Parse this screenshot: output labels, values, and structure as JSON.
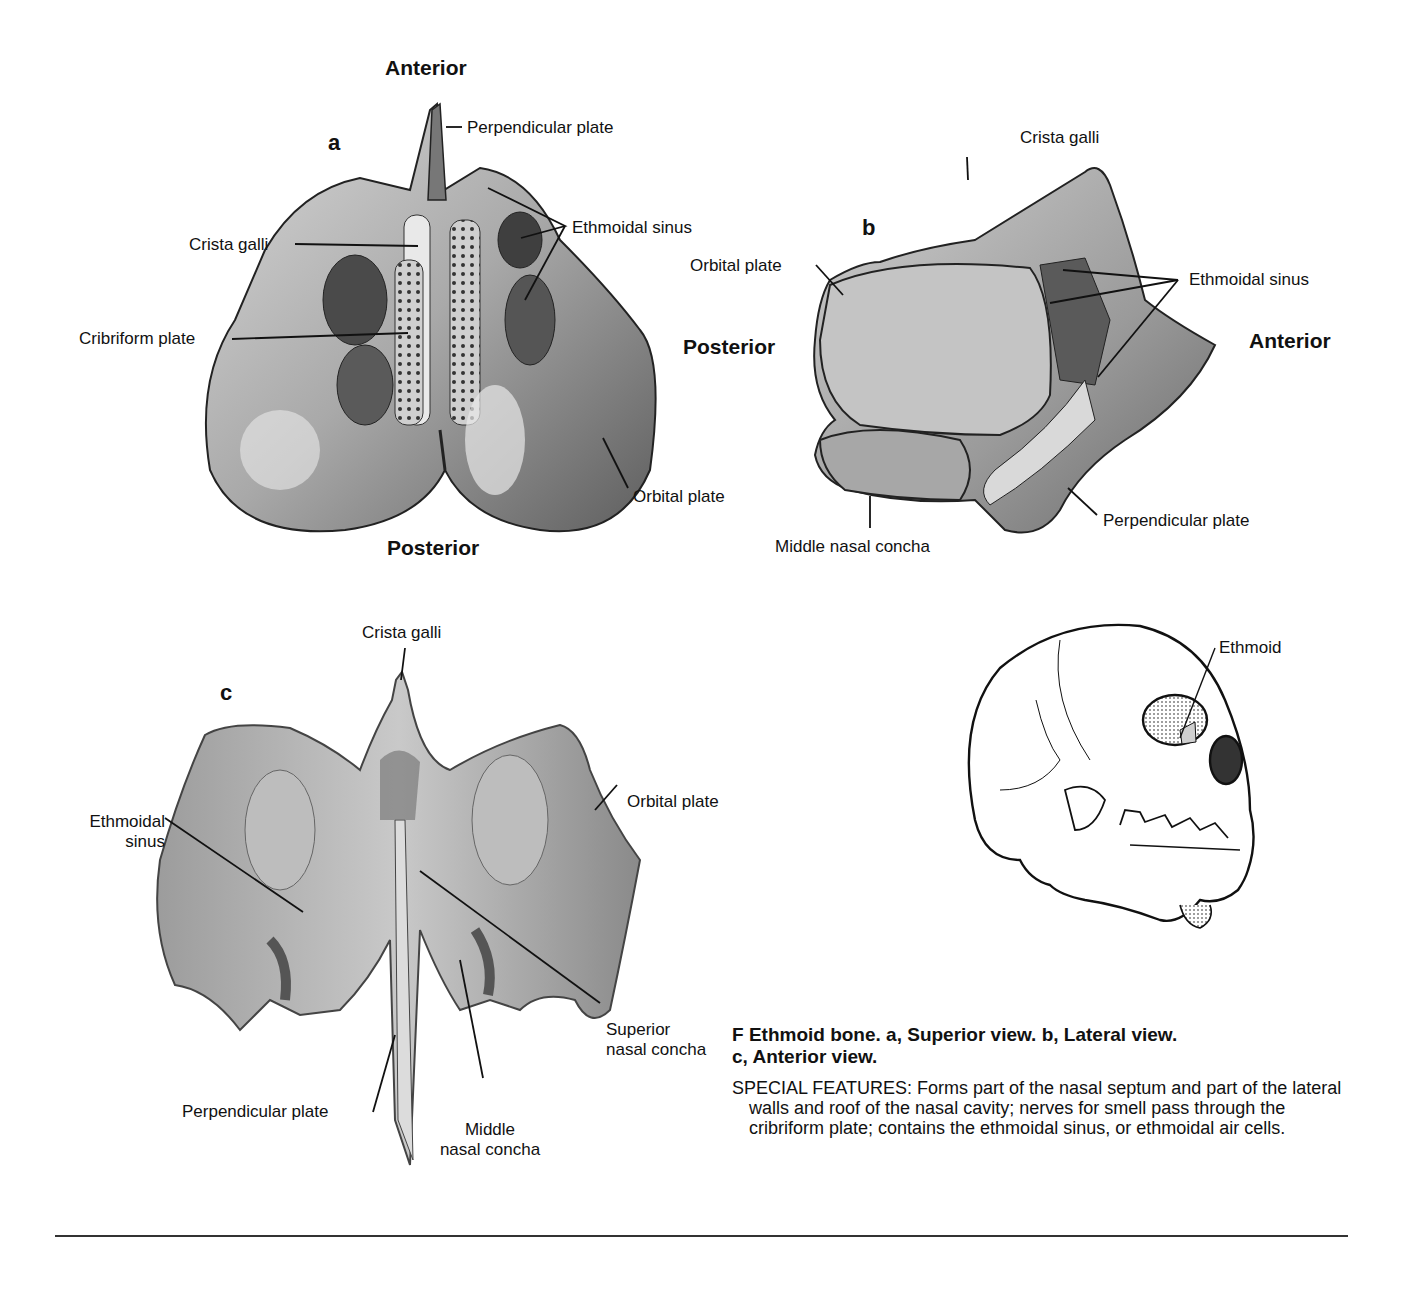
{
  "figure": {
    "panel_a": {
      "letter": "a",
      "orientation_top": "Anterior",
      "orientation_bottom": "Posterior",
      "labels": {
        "perpendicular_plate": "Perpendicular plate",
        "ethmoidal_sinus": "Ethmoidal sinus",
        "crista_galli": "Crista galli",
        "cribriform_plate": "Cribriform plate",
        "orbital_plate": "Orbital plate"
      }
    },
    "panel_b": {
      "letter": "b",
      "orientation_left": "Posterior",
      "orientation_right": "Anterior",
      "labels": {
        "crista_galli": "Crista galli",
        "orbital_plate": "Orbital plate",
        "ethmoidal_sinus": "Ethmoidal sinus",
        "middle_nasal_concha": "Middle nasal concha",
        "perpendicular_plate": "Perpendicular plate"
      }
    },
    "panel_c": {
      "letter": "c",
      "labels": {
        "crista_galli": "Crista galli",
        "ethmoidal_sinus_line1": "Ethmoidal",
        "ethmoidal_sinus_line2": "sinus",
        "orbital_plate": "Orbital plate",
        "superior_nasal_concha_line1": "Superior",
        "superior_nasal_concha_line2": "nasal concha",
        "perpendicular_plate": "Perpendicular plate",
        "middle_nasal_concha_line1": "Middle",
        "middle_nasal_concha_line2": "nasal concha"
      }
    },
    "skull": {
      "label": "Ethmoid"
    },
    "caption": {
      "title_line1": "F Ethmoid bone. a, Superior view. b, Lateral view.",
      "title_line2": "c, Anterior view.",
      "body": "SPECIAL FEATURES: Forms part of the nasal septum and part of the lateral walls and roof of the nasal cavity; nerves for smell pass through the cribriform plate; contains the ethmoidal sinus, or ethmoidal air cells."
    }
  }
}
